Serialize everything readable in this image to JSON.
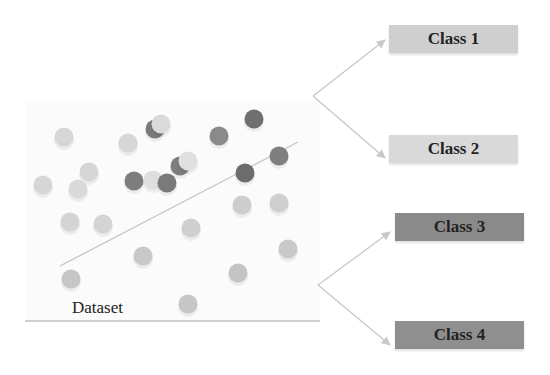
{
  "dataset": {
    "label": "Dataset",
    "points": [
      {
        "x": 64,
        "y": 137,
        "color": "#d6d6d6"
      },
      {
        "x": 128,
        "y": 143,
        "color": "#d6d6d6"
      },
      {
        "x": 155,
        "y": 129,
        "color": "#7a7a7a"
      },
      {
        "x": 161,
        "y": 124,
        "color": "#dadada"
      },
      {
        "x": 219,
        "y": 136,
        "color": "#8a8a8a"
      },
      {
        "x": 254,
        "y": 119,
        "color": "#6f6f6f"
      },
      {
        "x": 89,
        "y": 172,
        "color": "#d6d6d6"
      },
      {
        "x": 43,
        "y": 185,
        "color": "#d6d6d6"
      },
      {
        "x": 78,
        "y": 189,
        "color": "#d9d9d9"
      },
      {
        "x": 134,
        "y": 181,
        "color": "#7d7d7d"
      },
      {
        "x": 153,
        "y": 180,
        "color": "#dedede"
      },
      {
        "x": 167,
        "y": 183,
        "color": "#7a7a7a"
      },
      {
        "x": 180,
        "y": 166,
        "color": "#7d7d7d"
      },
      {
        "x": 188,
        "y": 161,
        "color": "#e0e0e0"
      },
      {
        "x": 245,
        "y": 173,
        "color": "#6c6c6c"
      },
      {
        "x": 279,
        "y": 156,
        "color": "#7f7f7f"
      },
      {
        "x": 70,
        "y": 222,
        "color": "#d4d4d4"
      },
      {
        "x": 103,
        "y": 224,
        "color": "#d4d4d4"
      },
      {
        "x": 191,
        "y": 228,
        "color": "#cfcfcf"
      },
      {
        "x": 242,
        "y": 205,
        "color": "#cdcdcd"
      },
      {
        "x": 279,
        "y": 203,
        "color": "#cfcfcf"
      },
      {
        "x": 143,
        "y": 256,
        "color": "#c8c8c8"
      },
      {
        "x": 288,
        "y": 249,
        "color": "#c8c8c8"
      },
      {
        "x": 71,
        "y": 279,
        "color": "#c6c6c6"
      },
      {
        "x": 238,
        "y": 273,
        "color": "#c4c4c4"
      },
      {
        "x": 188,
        "y": 304,
        "color": "#c6c6c6"
      }
    ],
    "separator": {
      "x1": 60,
      "y1": 266,
      "x2": 298,
      "y2": 142
    },
    "baseline_y": 321
  },
  "classes": [
    {
      "label": "Class 1",
      "x": 389,
      "y": 25,
      "w": 129,
      "h": 28,
      "fill": "#cfcfcf"
    },
    {
      "label": "Class 2",
      "x": 389,
      "y": 135,
      "w": 129,
      "h": 28,
      "fill": "#d9d9d9"
    },
    {
      "label": "Class 3",
      "x": 395,
      "y": 213,
      "w": 129,
      "h": 28,
      "fill": "#8a8a8a"
    },
    {
      "label": "Class 4",
      "x": 395,
      "y": 321,
      "w": 129,
      "h": 28,
      "fill": "#8f8f8f"
    }
  ],
  "arrows": [
    {
      "from": [
        313,
        96
      ],
      "to": [
        385,
        40
      ]
    },
    {
      "from": [
        313,
        96
      ],
      "to": [
        385,
        158
      ]
    },
    {
      "from": [
        318,
        285
      ],
      "to": [
        390,
        232
      ]
    },
    {
      "from": [
        318,
        285
      ],
      "to": [
        390,
        345
      ]
    }
  ]
}
